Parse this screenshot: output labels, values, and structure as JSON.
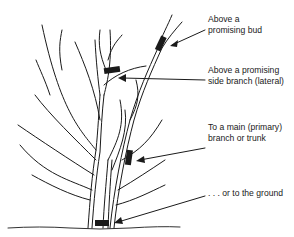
{
  "diagram": {
    "labels": [
      {
        "id": "bud",
        "line1": "Above a",
        "line2": "promising bud"
      },
      {
        "id": "lateral",
        "line1": "Above a promising",
        "line2": "side branch (lateral)"
      },
      {
        "id": "primary",
        "line1": "To a main (primary)",
        "line2": "branch or trunk"
      },
      {
        "id": "ground",
        "line1": ". . . or to the ground",
        "line2": ""
      }
    ],
    "colors": {
      "ink": "#1a1a1a",
      "background": "#ffffff"
    }
  }
}
